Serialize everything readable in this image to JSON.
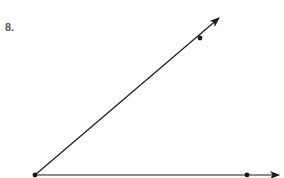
{
  "problem": {
    "number_label": "8."
  },
  "figure": {
    "type": "angle",
    "stroke_color": "#1a1a1a",
    "vertex": {
      "x": 35,
      "y": 175
    },
    "upper_ray": {
      "point": {
        "x": 200,
        "y": 38
      },
      "arrow_tip": {
        "x": 219,
        "y": 18
      }
    },
    "lower_ray": {
      "point": {
        "x": 247,
        "y": 175
      },
      "arrow_tip": {
        "x": 279,
        "y": 175
      }
    }
  }
}
